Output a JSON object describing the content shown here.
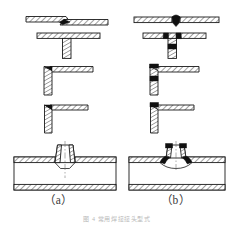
{
  "figure": {
    "background_color": "#ffffff",
    "line_color": "#1a1a1a",
    "hatch_color": "#2a2a2a",
    "weld_bead_color": "#101010",
    "metal_fill_color": "#ffffff",
    "caption_color": "#3a3a3a",
    "title_color": "#b8b8b8",
    "width": 234,
    "height": 227
  },
  "captions": [
    {
      "id": "caption-a",
      "label": "（a）"
    },
    {
      "id": "caption-b",
      "label": "（b）"
    }
  ],
  "figure_title": "图 4  常用焊接接头型式",
  "columns": [
    {
      "id": "column-a",
      "caption": "（a）",
      "state": "before-welding",
      "description": "Joint edge preparations shown before welding"
    },
    {
      "id": "column-b",
      "caption": "（b）",
      "state": "after-welding",
      "description": "Same joints shown after welding with deposited weld bead"
    }
  ],
  "rows": [
    {
      "id": "row-1",
      "joint_type": "butt-joint",
      "label_a": "Butt joint with V groove, unwelded",
      "label_b": "Butt joint with V groove, welded"
    },
    {
      "id": "row-2",
      "joint_type": "tee-joint",
      "label_a": "Tee joint, unwelded",
      "label_b": "Tee joint, welded with fillet welds"
    },
    {
      "id": "row-3",
      "joint_type": "corner-joint",
      "label_a": "Corner joint, unwelded",
      "label_b": "Corner joint, welded"
    },
    {
      "id": "row-4",
      "joint_type": "lap-corner-joint",
      "label_a": "Edge/corner joint, unwelded",
      "label_b": "Edge/corner joint, welded"
    },
    {
      "id": "row-5",
      "joint_type": "pipe-branch-joint",
      "label_a": "Pipe branch (tee) connection, unwelded",
      "label_b": "Pipe branch (tee) connection, welded"
    }
  ]
}
